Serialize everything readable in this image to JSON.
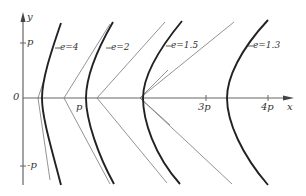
{
  "diagram": {
    "type": "family of hyperbolas (conic sections) with varying eccentricity",
    "axes": {
      "x_label": "x",
      "y_label": "y",
      "origin_label": "0",
      "x_ticks": [
        {
          "label": "p",
          "value": 1
        },
        {
          "label": "3p",
          "value": 3
        },
        {
          "label": "4p",
          "value": 4
        }
      ],
      "y_ticks": [
        {
          "label": "p",
          "value": 1
        },
        {
          "label": "-p",
          "value": -1
        }
      ]
    },
    "curves": [
      {
        "label": "e=4",
        "eccentricity": 4
      },
      {
        "label": "e=2",
        "eccentricity": 2
      },
      {
        "label": "e=1.5",
        "eccentricity": 1.5
      },
      {
        "label": "e=1.3",
        "eccentricity": 1.3
      }
    ]
  }
}
